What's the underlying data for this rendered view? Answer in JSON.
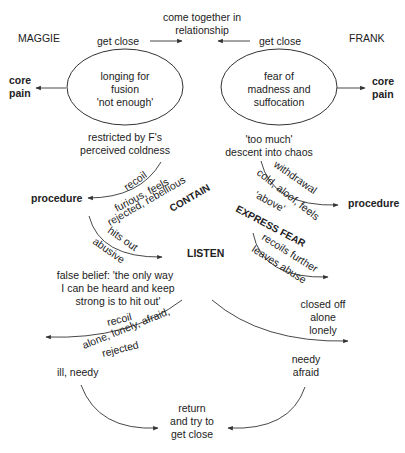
{
  "title_top": [
    "come together in",
    "relationship"
  ],
  "left": {
    "name": "MAGGIE",
    "get_close": "get close",
    "core_pain": [
      "core",
      "pain"
    ],
    "ellipse_text": [
      "longing for",
      "fusion",
      "'not enough'"
    ],
    "restricted": [
      "restricted by F's",
      "perceived coldness"
    ],
    "recoil_1": "recoil",
    "procedure": "procedure",
    "feel_1": "furious, feels",
    "feel_2": "rejected, rebellious",
    "contain": "CONTAIN",
    "hits_out": "hits out",
    "abusive": "abusive",
    "false_belief": [
      "false belief: 'the only way",
      "I can be heard and keep",
      "strong is to hit out'"
    ],
    "recoil_2": "recoil",
    "feel_3": "alone, lonely, afraid,",
    "feel_4": "rejected",
    "ill_needy": "ill, needy"
  },
  "right": {
    "name": "FRANK",
    "get_close": "get close",
    "core_pain": [
      "core",
      "pain"
    ],
    "ellipse_text": [
      "fear of",
      "madness and",
      "suffocation"
    ],
    "too_much": [
      "'too much'",
      "descent into chaos"
    ],
    "withdrawal": "withdrawal",
    "cold_1": "cold, aloof, feels",
    "cold_2": "'above'",
    "procedure": "procedure",
    "express_fear": "EXPRESS FEAR",
    "recoils_further": "recoils further",
    "leaves_abuse": "leaves abuse",
    "closed_off": [
      "closed off",
      "alone",
      "lonely"
    ],
    "needy_afraid": [
      "needy",
      "afraid"
    ]
  },
  "center": {
    "listen": "LISTEN",
    "return": [
      "return",
      "and try to",
      "get close"
    ]
  }
}
